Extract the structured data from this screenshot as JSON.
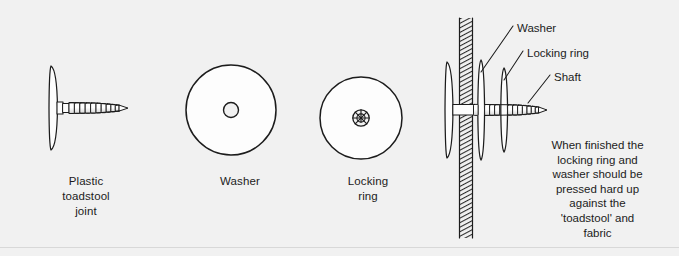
{
  "figure": {
    "background_color": "#f1f1f1",
    "ink_color": "#1c1c1c"
  },
  "parts": [
    {
      "id": "toadstool-joint",
      "caption": "Plastic\ntoadstool\njoint",
      "icon": "toadstool-screw-icon"
    },
    {
      "id": "washer",
      "caption": "Washer",
      "icon": "washer-disc-icon"
    },
    {
      "id": "locking-ring",
      "caption": "Locking\nring",
      "icon": "locking-ring-disc-icon"
    }
  ],
  "assembly": {
    "labels": [
      {
        "id": "washer",
        "text": "Washer"
      },
      {
        "id": "locking-ring",
        "text": "Locking ring"
      },
      {
        "id": "shaft",
        "text": "Shaft"
      }
    ],
    "note": "When finished the\nlocking ring and\nwasher should be\npressed hard up\nagainst the\n'toadstool' and\nfabric"
  }
}
